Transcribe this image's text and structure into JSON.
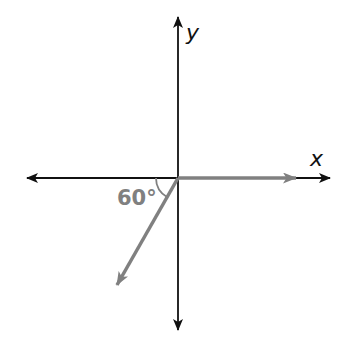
{
  "diagram": {
    "type": "vector-diagram",
    "axes": {
      "x_label": "x",
      "y_label": "y",
      "origin": [
        178,
        178
      ],
      "x_axis": {
        "from": [
          27,
          178
        ],
        "to": [
          330,
          178
        ]
      },
      "y_axis": {
        "from": [
          178,
          330
        ],
        "to": [
          178,
          17
        ]
      }
    },
    "vectors": [
      {
        "name": "horizontal-vector",
        "from": [
          178,
          178
        ],
        "to": [
          296,
          178
        ],
        "color": "#808080"
      },
      {
        "name": "diagonal-vector",
        "from": [
          178,
          178
        ],
        "to": [
          117,
          285
        ],
        "color": "#808080"
      }
    ],
    "angle": {
      "label": "60°",
      "degrees": 60,
      "between": [
        "negative-x-axis",
        "diagonal-vector"
      ]
    },
    "colors": {
      "axis": "#111111",
      "vector": "#808080",
      "angle_label": "#808080",
      "background": "#ffffff"
    }
  }
}
